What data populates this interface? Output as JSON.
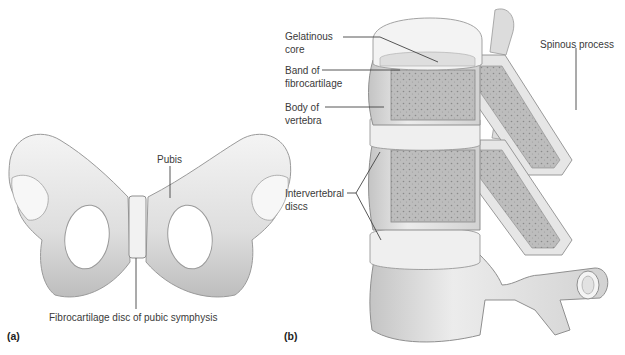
{
  "figure": {
    "panels": [
      {
        "id": "a",
        "tag": "(a)",
        "labels": {
          "pubis": "Pubis",
          "disc": "Fibrocartilage disc of pubic symphysis"
        }
      },
      {
        "id": "b",
        "tag": "(b)",
        "labels": {
          "gelatinous_core_1": "Gelatinous",
          "gelatinous_core_2": "core",
          "band_1": "Band of",
          "band_2": "fibrocartilage",
          "body_1": "Body of",
          "body_2": "vertebra",
          "discs_1": "Intervertebral",
          "discs_2": "discs",
          "spinous": "Spinous process"
        }
      }
    ],
    "colors": {
      "background": "#ffffff",
      "bone_light": "#eeeeee",
      "bone_mid": "#d4d4d4",
      "bone_shadow": "#a8a8a8",
      "spongy": "#b9b9b9",
      "leader_line": "#444444",
      "text": "#3a3a3a"
    }
  }
}
